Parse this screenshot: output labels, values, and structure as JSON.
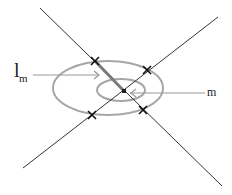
{
  "diagram": {
    "labels": {
      "left_label_main": "l",
      "left_label_sub": "m",
      "right_label": "m"
    },
    "colors": {
      "line": "#333333",
      "ellipse": "#a6a6a6",
      "arrow": "#999999",
      "highlight_segment": "#7a7a7a",
      "marker": "#111111",
      "center_point": "#222222"
    },
    "lines": [
      {
        "name": "line-nw-se",
        "x1": 40,
        "y1": 8,
        "x2": 222,
        "y2": 186
      },
      {
        "name": "line-sw-ne",
        "x1": 23,
        "y1": 168,
        "x2": 218,
        "y2": 17
      }
    ],
    "ellipses": [
      {
        "name": "outer-ellipse",
        "cx": 108,
        "cy": 88,
        "rx": 55,
        "ry": 27
      },
      {
        "name": "inner-ellipse",
        "cx": 121,
        "cy": 90,
        "rx": 24,
        "ry": 11
      }
    ],
    "markers": [
      {
        "name": "intersection-marker-top-left",
        "x": 95,
        "y": 61
      },
      {
        "name": "intersection-marker-top-right",
        "x": 147,
        "y": 70
      },
      {
        "name": "intersection-marker-bottom-left",
        "x": 92,
        "y": 115
      },
      {
        "name": "intersection-marker-bottom-right",
        "x": 143,
        "y": 110
      }
    ],
    "center_point": {
      "x": 124,
      "y": 91
    },
    "highlight_segment": {
      "x1": 95,
      "y1": 61,
      "x2": 124,
      "y2": 91
    }
  }
}
